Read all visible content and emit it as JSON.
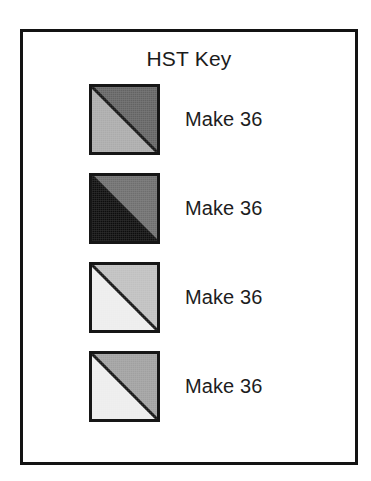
{
  "page": {
    "background_color": "#ffffff",
    "frame_border_color": "#131313"
  },
  "key": {
    "title": "HST Key",
    "rows": [
      {
        "label": "Make 36",
        "block": {
          "name": "hst-block-dark-gray-over-light-gray",
          "upper_color": "#636363",
          "lower_color": "#ababab",
          "border_color": "#161616",
          "diagonal_color": "#111111"
        }
      },
      {
        "label": "Make 36",
        "block": {
          "name": "hst-block-gray-over-black",
          "upper_color": "#6e6e6e",
          "lower_color": "#0d0d0d",
          "border_color": "#161616",
          "diagonal_color": "#111111"
        }
      },
      {
        "label": "Make 36",
        "block": {
          "name": "hst-block-light-gray-over-white",
          "upper_color": "#c0c0c0",
          "lower_color": "#ededed",
          "border_color": "#161616",
          "diagonal_color": "#111111"
        }
      },
      {
        "label": "Make 36",
        "block": {
          "name": "hst-block-medium-gray-over-white",
          "upper_color": "#a0a0a0",
          "lower_color": "#ededed",
          "border_color": "#161616",
          "diagonal_color": "#111111"
        }
      }
    ]
  }
}
